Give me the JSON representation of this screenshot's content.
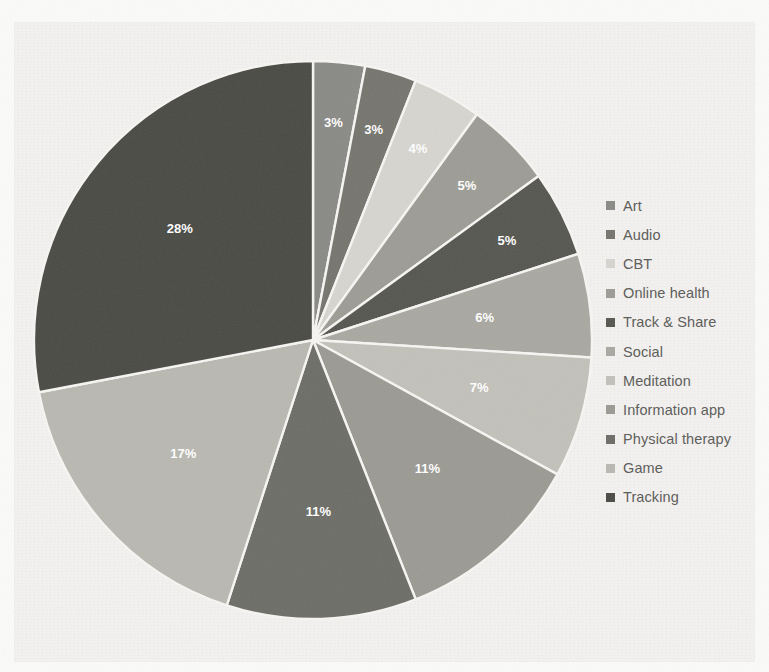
{
  "chart_data": {
    "type": "pie",
    "title": "",
    "labels": [
      "Art",
      "Audio",
      "CBT",
      "Online health",
      "Track & Share",
      "Social",
      "Meditation",
      "Information app",
      "Physical therapy",
      "Game",
      "Tracking"
    ],
    "values": [
      3,
      3,
      4,
      5,
      5,
      6,
      7,
      11,
      11,
      17,
      28
    ],
    "value_suffix": "%",
    "data_labels": [
      "3%",
      "3%",
      "4%",
      "5%",
      "5%",
      "6%",
      "7%",
      "11%",
      "11%",
      "17%",
      "28%"
    ],
    "colors": [
      "#8a8a87",
      "#76766f",
      "#d6d5cf",
      "#9d9d96",
      "#575751",
      "#a9a8a1",
      "#c2c1ba",
      "#9b9a93",
      "#6e6e68",
      "#b9b8b1",
      "#4b4b46"
    ],
    "start_angle_deg": 0,
    "direction": "clockwise",
    "legend_position": "right",
    "grid": false,
    "total": 100
  },
  "legend": {
    "items": [
      {
        "label": "Art",
        "color": "#8a8a87"
      },
      {
        "label": "Audio",
        "color": "#76766f"
      },
      {
        "label": "CBT",
        "color": "#d6d5cf"
      },
      {
        "label": "Online health",
        "color": "#9d9d96"
      },
      {
        "label": "Track & Share",
        "color": "#575751"
      },
      {
        "label": "Social",
        "color": "#a9a8a1"
      },
      {
        "label": "Meditation",
        "color": "#c2c1ba"
      },
      {
        "label": "Information app",
        "color": "#9b9a93"
      },
      {
        "label": "Physical therapy",
        "color": "#6e6e68"
      },
      {
        "label": "Game",
        "color": "#b9b8b1"
      },
      {
        "label": "Tracking",
        "color": "#4b4b46"
      }
    ]
  }
}
